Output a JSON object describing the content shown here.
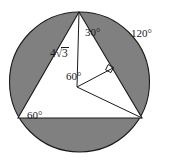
{
  "figure": {
    "type": "geometry-diagram",
    "colors": {
      "shaded_region": "#808080",
      "unshaded_region": "#ffffff",
      "stroke": "#1a1a1a",
      "background": "#ffffff"
    },
    "circle": {
      "center_x": 79.5,
      "center_y": 82,
      "radius": 70
    },
    "triangle": {
      "apex_x": 79,
      "apex_y": 12,
      "bottom_left_x": 18,
      "bottom_left_y": 118,
      "bottom_right_x": 142,
      "bottom_right_y": 118
    },
    "center_point": {
      "x": 77,
      "y": 87
    },
    "right_angle_marker": {
      "present": true,
      "x": 110,
      "y": 72
    },
    "labels": {
      "apex_angle": "30°",
      "side_length_radical": "√",
      "side_length_coefficient": "4",
      "side_length_radicand": "3",
      "side_length_full": "4√3",
      "arc_angle": "120°",
      "center_angle": "60°",
      "base_angle": "60°"
    }
  }
}
